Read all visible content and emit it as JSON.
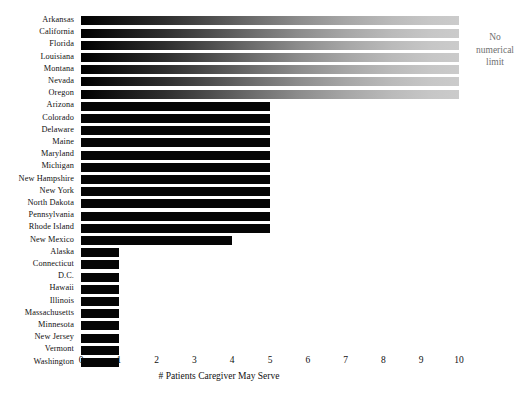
{
  "chart_data": {
    "type": "bar",
    "orientation": "horizontal",
    "title": "",
    "xlabel": "# Patients Caregiver May Serve",
    "ylabel": "",
    "xlim": [
      0,
      10
    ],
    "xticks": [
      0,
      1,
      2,
      3,
      4,
      5,
      6,
      7,
      8,
      9,
      10
    ],
    "grid": false,
    "legend": false,
    "categories": [
      "Arkansas",
      "California",
      "Florida",
      "Louisiana",
      "Montana",
      "Nevada",
      "Oregon",
      "Arizona",
      "Colorado",
      "Delaware",
      "Maine",
      "Maryland",
      "Michigan",
      "New Hampshire",
      "New York",
      "North Dakota",
      "Pennsylvania",
      "Rhode Island",
      "New Mexico",
      "Alaska",
      "Connecticut",
      "D.C.",
      "Hawaii",
      "Illinois",
      "Massachusetts",
      "Minnesota",
      "New Jersey",
      "Vermont",
      "Washington"
    ],
    "values": [
      10,
      10,
      10,
      10,
      10,
      10,
      10,
      5,
      5,
      5,
      5,
      5,
      5,
      5,
      5,
      5,
      5,
      5,
      4,
      1,
      1,
      1,
      1,
      1,
      1,
      1,
      1,
      1,
      1
    ],
    "unlimited_flags": [
      true,
      true,
      true,
      true,
      true,
      true,
      true,
      false,
      false,
      false,
      false,
      false,
      false,
      false,
      false,
      false,
      false,
      false,
      false,
      false,
      false,
      false,
      false,
      false,
      false,
      false,
      false,
      false,
      false
    ],
    "annotations": [
      {
        "name": "no-numerical-limit",
        "lines": [
          "No",
          "numerical",
          "limit"
        ],
        "applies_to": [
          "Arkansas",
          "California",
          "Florida",
          "Louisiana",
          "Montana",
          "Nevada",
          "Oregon"
        ],
        "color": "#6f6f6f"
      }
    ],
    "colors": {
      "bar": "#050505",
      "bar_gradient_start": "#000000",
      "bar_gradient_end": "#cbcbcb",
      "background": "#ffffff",
      "text": "#111111"
    }
  }
}
